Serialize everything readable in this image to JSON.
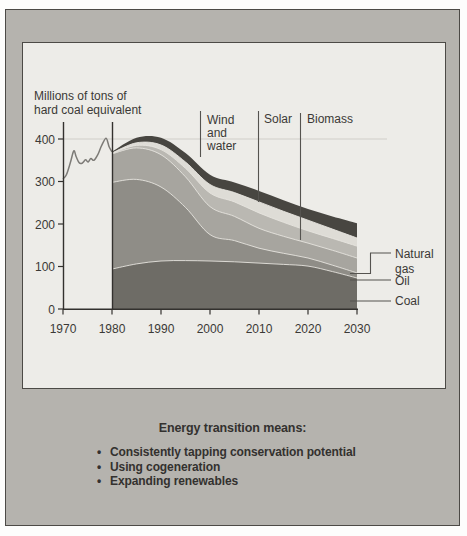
{
  "figure": {
    "y_axis_title_lines": [
      "Millions of tons of",
      "hard coal equivalent"
    ],
    "annotations": {
      "wind_water": {
        "lines": [
          "Wind",
          "and",
          "water"
        ]
      },
      "solar": {
        "label": "Solar"
      },
      "biomass": {
        "label": "Biomass"
      }
    },
    "legend": {
      "natural_gas": {
        "lines": [
          "Natural",
          "gas"
        ]
      },
      "oil": {
        "label": "Oil"
      },
      "coal": {
        "label": "Coal"
      }
    },
    "colors": {
      "panel_bg": "#edece8",
      "frame_bg": "#b5b3ae",
      "axis": "#33312e",
      "gridline": "#d0cec9",
      "historical_line": "#7d7b77",
      "band_edge": "#e6e4df"
    }
  },
  "caption": {
    "title": "Energy transition means:",
    "bullets": [
      "Consistently tapping conservation potential",
      "Using cogeneration",
      "Expanding renewables"
    ]
  },
  "chart_data": {
    "type": "area",
    "stacked": true,
    "title": "",
    "xlabel": "",
    "ylabel": "Millions of tons of hard coal equivalent",
    "xlim": [
      1970,
      2030
    ],
    "ylim": [
      0,
      430
    ],
    "grid": "single faint line at y=400",
    "legend_position": "right",
    "x_axis": {
      "ticks": [
        1970,
        1980,
        1990,
        2000,
        2010,
        2020,
        2030
      ]
    },
    "y_axis": {
      "ticks": [
        400,
        300,
        200,
        100,
        0
      ]
    },
    "x": [
      1980,
      1985,
      1990,
      1995,
      2000,
      2005,
      2010,
      2015,
      2020,
      2025,
      2030
    ],
    "series": [
      {
        "name": "Coal",
        "color": "#6e6c66",
        "values": [
          94,
          106,
          113,
          114,
          113,
          111,
          108,
          105,
          101,
          88,
          73
        ]
      },
      {
        "name": "Oil",
        "color": "#8f8d87",
        "values": [
          204,
          199,
          174,
          125,
          62,
          50,
          35,
          26,
          19,
          15,
          12
        ]
      },
      {
        "name": "Natural gas",
        "color": "#a7a59f",
        "values": [
          67,
          74,
          76,
          72,
          66,
          57,
          47,
          40,
          35,
          35,
          35
        ]
      },
      {
        "name": "Biomass",
        "color": "#bab8b2",
        "values": [
          1,
          6,
          12,
          20,
          32,
          34,
          36,
          33,
          29,
          28,
          28
        ]
      },
      {
        "name": "Solar",
        "color": "#dedcd6",
        "values": [
          1,
          6,
          11,
          15,
          20,
          22,
          26,
          26,
          25,
          22,
          19
        ]
      },
      {
        "name": "Wind and water",
        "color": "#484641",
        "values": [
          3,
          12,
          17,
          21,
          23,
          24,
          26,
          26,
          26,
          30,
          35
        ]
      }
    ],
    "historical_line": {
      "name": "Total primary energy 1970-1980 (historical)",
      "x": [
        1970,
        1970.7,
        1971.5,
        1972.2,
        1972.7,
        1973.3,
        1973.9,
        1974.6,
        1975.1,
        1975.7,
        1976.3,
        1977.1,
        1977.9,
        1978.8,
        1979.4,
        1980
      ],
      "y": [
        306,
        316,
        344,
        372,
        358,
        344,
        343,
        351,
        346,
        354,
        350,
        363,
        385,
        402,
        382,
        370
      ]
    }
  }
}
